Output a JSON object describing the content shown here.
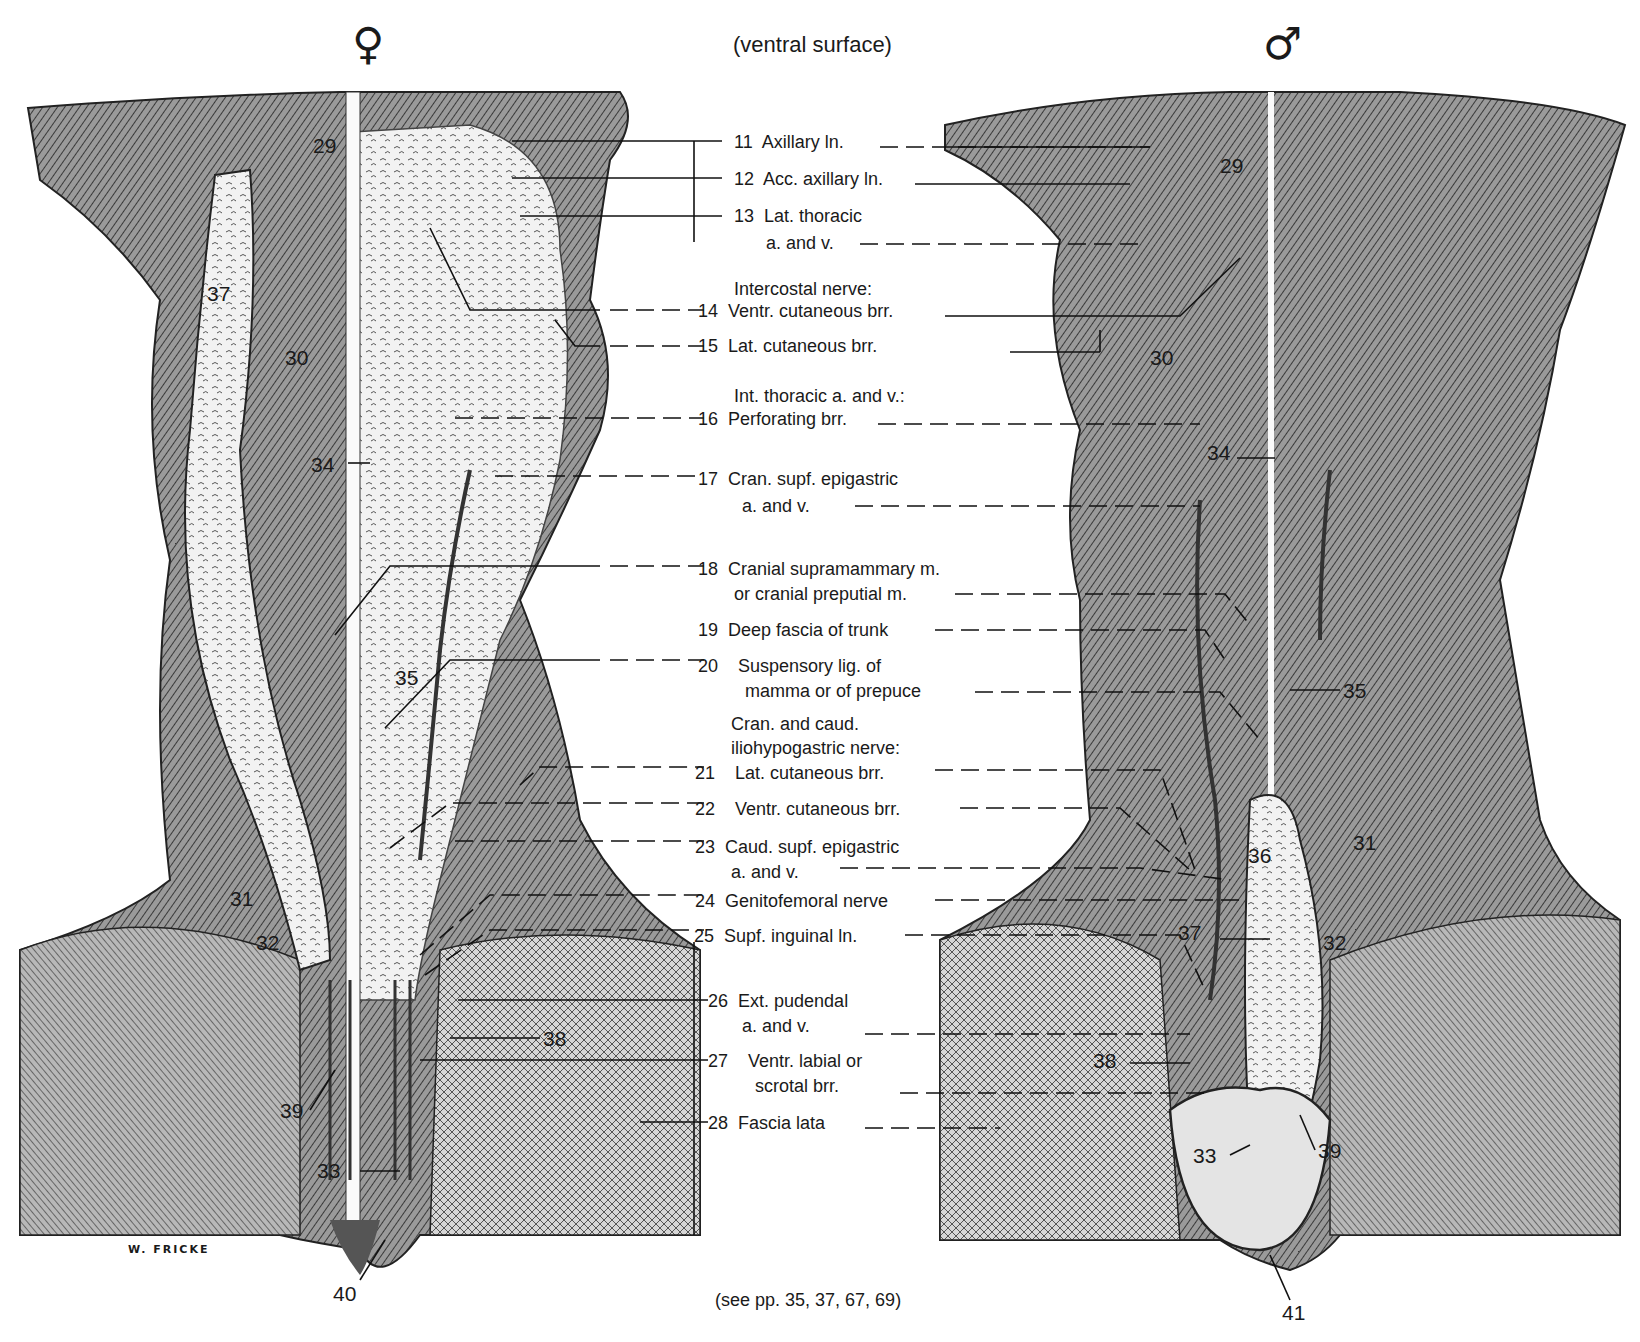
{
  "header": {
    "female_symbol": "♀",
    "male_symbol": "♂",
    "title": "(ventral surface)"
  },
  "legend": [
    {
      "num": "11",
      "lines": [
        "Axillary ln."
      ]
    },
    {
      "num": "12",
      "lines": [
        "Acc. axillary ln."
      ]
    },
    {
      "num": "13",
      "lines": [
        "Lat. thoracic",
        "a. and v."
      ]
    },
    {
      "num": "14",
      "heading": "Intercostal nerve:",
      "lines": [
        "Ventr. cutaneous brr."
      ]
    },
    {
      "num": "15",
      "lines": [
        "Lat. cutaneous brr."
      ]
    },
    {
      "num": "16",
      "heading": "Int. thoracic a. and v.:",
      "lines": [
        "Perforating brr."
      ]
    },
    {
      "num": "17",
      "lines": [
        "Cran. supf. epigastric",
        "a. and v."
      ]
    },
    {
      "num": "18",
      "lines": [
        "Cranial supramammary m.",
        "or cranial preputial m."
      ]
    },
    {
      "num": "19",
      "lines": [
        "Deep fascia of trunk"
      ]
    },
    {
      "num": "20",
      "lines": [
        "Suspensory lig. of",
        "mamma or of prepuce"
      ]
    },
    {
      "num": "21",
      "heading": "Cran. and caud.",
      "heading2": "iliohypogastric nerve:",
      "lines": [
        "Lat. cutaneous brr."
      ]
    },
    {
      "num": "22",
      "lines": [
        "Ventr. cutaneous brr."
      ]
    },
    {
      "num": "23",
      "lines": [
        "Caud. supf. epigastric",
        "a. and v."
      ]
    },
    {
      "num": "24",
      "lines": [
        "Genitofemoral nerve"
      ]
    },
    {
      "num": "25",
      "lines": [
        "Supf. inguinal ln."
      ]
    },
    {
      "num": "26",
      "lines": [
        "Ext. pudendal",
        "a. and v."
      ]
    },
    {
      "num": "27",
      "lines": [
        "Ventr. labial or",
        "scrotal brr."
      ]
    },
    {
      "num": "28",
      "lines": [
        "Fascia lata"
      ]
    }
  ],
  "female_figure": {
    "labels": [
      "29",
      "30",
      "37",
      "34",
      "35",
      "31",
      "32",
      "39",
      "33",
      "38",
      "40"
    ],
    "signature": "W. FRICKE"
  },
  "male_figure": {
    "labels": [
      "29",
      "30",
      "34",
      "35",
      "36",
      "31",
      "37",
      "32",
      "38",
      "33",
      "39",
      "41"
    ]
  },
  "footer": {
    "caption": "(see pp. 35, 37, 67, 69)"
  }
}
